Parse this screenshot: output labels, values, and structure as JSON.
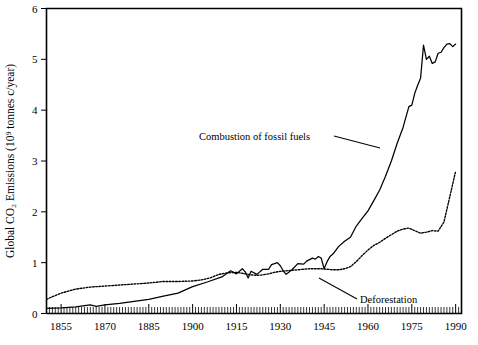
{
  "chart_data": {
    "type": "line",
    "title": "",
    "xlabel": "",
    "ylabel": "Global CO₂ Emissions (10⁹ tonnes c/year)",
    "xlim": [
      1850,
      1992
    ],
    "ylim": [
      0,
      6
    ],
    "grid": false,
    "legend_position": "inline-annotations",
    "xticks": [
      1855,
      1870,
      1885,
      1900,
      1915,
      1930,
      1945,
      1960,
      1975,
      1990
    ],
    "xtick_labels": [
      "1855",
      "1870",
      "1885",
      "1900",
      "1915",
      "1930",
      "1945",
      "1960",
      "1975",
      "1990"
    ],
    "xminor_tick_step": 1,
    "yticks": [
      0,
      1,
      2,
      3,
      4,
      5,
      6
    ],
    "ytick_labels": [
      "0",
      "1",
      "2",
      "3",
      "4",
      "5",
      "6"
    ],
    "series": [
      {
        "name": "Combustion of fossil fuels",
        "style": "solid",
        "x": [
          1850,
          1855,
          1860,
          1865,
          1867,
          1870,
          1875,
          1880,
          1885,
          1890,
          1895,
          1900,
          1905,
          1910,
          1913,
          1915,
          1917,
          1918,
          1919,
          1920,
          1922,
          1924,
          1926,
          1927,
          1929,
          1930,
          1931,
          1932,
          1934,
          1936,
          1938,
          1939,
          1940,
          1941,
          1942,
          1943,
          1944,
          1945,
          1946,
          1947,
          1948,
          1950,
          1952,
          1954,
          1956,
          1958,
          1960,
          1962,
          1964,
          1966,
          1968,
          1970,
          1972,
          1974,
          1975,
          1976,
          1977,
          1978,
          1979,
          1980,
          1981,
          1982,
          1983,
          1984,
          1985,
          1986,
          1987,
          1988,
          1989,
          1990
        ],
        "y": [
          0.1,
          0.11,
          0.13,
          0.17,
          0.14,
          0.17,
          0.2,
          0.24,
          0.28,
          0.34,
          0.4,
          0.53,
          0.62,
          0.72,
          0.84,
          0.78,
          0.88,
          0.82,
          0.7,
          0.83,
          0.77,
          0.87,
          0.87,
          0.96,
          1.0,
          0.94,
          0.84,
          0.77,
          0.86,
          0.98,
          0.97,
          1.03,
          1.06,
          1.09,
          1.07,
          1.12,
          1.09,
          0.88,
          1.02,
          1.12,
          1.17,
          1.32,
          1.42,
          1.5,
          1.72,
          1.87,
          2.02,
          2.22,
          2.43,
          2.7,
          3.0,
          3.35,
          3.66,
          4.07,
          4.1,
          4.33,
          4.49,
          4.63,
          5.28,
          5.0,
          5.06,
          4.92,
          4.95,
          5.12,
          5.14,
          5.23,
          5.3,
          5.31,
          5.25,
          5.3
        ]
      },
      {
        "name": "Deforestation",
        "style": "dotted",
        "x": [
          1850,
          1852,
          1855,
          1858,
          1860,
          1865,
          1870,
          1875,
          1880,
          1885,
          1890,
          1895,
          1900,
          1903,
          1906,
          1909,
          1912,
          1915,
          1918,
          1920,
          1922,
          1924,
          1926,
          1928,
          1930,
          1932,
          1934,
          1936,
          1938,
          1940,
          1942,
          1944,
          1946,
          1948,
          1950,
          1952,
          1954,
          1956,
          1958,
          1960,
          1962,
          1964,
          1966,
          1968,
          1970,
          1972,
          1974,
          1976,
          1978,
          1980,
          1982,
          1984,
          1986,
          1988,
          1990
        ],
        "y": [
          0.28,
          0.33,
          0.4,
          0.45,
          0.48,
          0.52,
          0.54,
          0.56,
          0.58,
          0.6,
          0.63,
          0.63,
          0.64,
          0.66,
          0.7,
          0.77,
          0.8,
          0.81,
          0.78,
          0.76,
          0.75,
          0.76,
          0.78,
          0.81,
          0.83,
          0.84,
          0.85,
          0.86,
          0.87,
          0.88,
          0.88,
          0.88,
          0.87,
          0.86,
          0.86,
          0.88,
          0.92,
          1.02,
          1.14,
          1.25,
          1.34,
          1.4,
          1.48,
          1.55,
          1.62,
          1.66,
          1.68,
          1.63,
          1.58,
          1.6,
          1.63,
          1.62,
          1.8,
          2.3,
          2.8
        ]
      }
    ],
    "annotations": [
      {
        "name": "fossil-fuels-annotation",
        "text": "Combustion of fossil fuels",
        "text_x": 199,
        "text_y": 140,
        "leader": {
          "x1": 334,
          "y1": 136,
          "x2": 380,
          "y2": 148
        }
      },
      {
        "name": "deforestation-annotation",
        "text": "Deforestation",
        "text_x": 360,
        "text_y": 303,
        "leader": {
          "x1": 319,
          "y1": 278,
          "x2": 357,
          "y2": 299
        }
      }
    ]
  },
  "figure": {
    "background_color": "#ffffff",
    "line_color": "#000000",
    "width": 478,
    "height": 345
  }
}
